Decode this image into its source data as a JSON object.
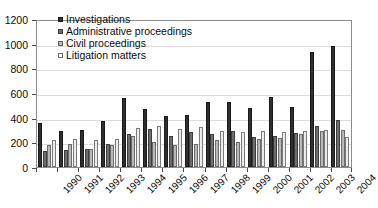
{
  "chart_data": {
    "type": "bar",
    "title": "",
    "subtitle": "",
    "xlabel": "",
    "ylabel": "",
    "ylim": [
      0,
      1200
    ],
    "yticks": [
      0,
      200,
      400,
      600,
      800,
      1000,
      1200
    ],
    "grid": true,
    "legend_position": "top-left-inside",
    "categories": [
      "1990",
      "1991",
      "1992",
      "1993",
      "1994",
      "1995",
      "1996",
      "1997",
      "1998",
      "1999",
      "2000",
      "2001",
      "2002",
      "2003",
      "2004"
    ],
    "series": [
      {
        "name": "Investigations",
        "color": "#2f2f2f",
        "values": [
          355,
          290,
          300,
          370,
          560,
          470,
          410,
          420,
          530,
          530,
          480,
          565,
          490,
          930,
          980
        ]
      },
      {
        "name": "Administrative proceedings",
        "color": "#6e6e6e",
        "values": [
          130,
          140,
          145,
          190,
          265,
          305,
          255,
          280,
          265,
          290,
          240,
          250,
          275,
          330,
          385
        ]
      },
      {
        "name": "Civil proceedings",
        "color": "#b9b9b9",
        "values": [
          180,
          190,
          150,
          175,
          255,
          200,
          180,
          190,
          215,
          205,
          225,
          235,
          265,
          290,
          300
        ]
      },
      {
        "name": "Litigation matters",
        "color": "#ededed",
        "values": [
          215,
          225,
          220,
          230,
          320,
          330,
          310,
          325,
          290,
          280,
          290,
          285,
          295,
          300,
          245
        ]
      }
    ]
  },
  "legend": {
    "items": [
      {
        "label": "Investigations"
      },
      {
        "label": "Administrative proceedings"
      },
      {
        "label": "Civil proceedings"
      },
      {
        "label": "Litigation matters"
      }
    ]
  }
}
